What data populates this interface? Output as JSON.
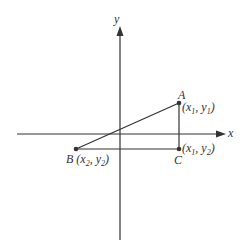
{
  "colors": {
    "line": "#333333",
    "background": "#ffffff"
  },
  "axes": {
    "x_label": "x",
    "y_label": "y"
  },
  "points": {
    "A": {
      "name": "A",
      "coord_open": "(",
      "x_var": "x",
      "x_sub": "1",
      "sep": ", ",
      "y_var": "y",
      "y_sub": "1",
      "coord_close": ")"
    },
    "B": {
      "name": "B",
      "coord_open": "(",
      "x_var": "x",
      "x_sub": "2",
      "sep": ", ",
      "y_var": "y",
      "y_sub": "2",
      "coord_close": ")"
    },
    "C": {
      "name": "C",
      "coord_open": "(",
      "x_var": "x",
      "x_sub": "1",
      "sep": ", ",
      "y_var": "y",
      "y_sub": "2",
      "coord_close": ")"
    }
  },
  "segments": [
    {
      "from": "B",
      "to": "A"
    },
    {
      "from": "B",
      "to": "C"
    },
    {
      "from": "A",
      "to": "C"
    }
  ]
}
